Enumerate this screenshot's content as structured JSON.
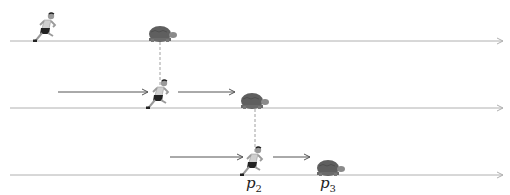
{
  "diagram": {
    "colors": {
      "track": "#b0b0b0",
      "arrow": "#555555",
      "dashed": "#888888",
      "tortoise_shell": "#5f5f5f",
      "tortoise_body": "#8a8a8a",
      "runner_skin": "#9a9a9a",
      "runner_shorts": "#222222",
      "runner_shirt": "#cfcfcf"
    },
    "rows": [
      {
        "track_y": 41,
        "runner_x": 45,
        "tortoise_x": 160,
        "arrows": []
      },
      {
        "track_y": 108,
        "runner_x": 158,
        "tortoise_x": 252,
        "arrows": [
          {
            "x1": 58,
            "x2": 148
          },
          {
            "x1": 178,
            "x2": 235
          }
        ]
      },
      {
        "track_y": 175,
        "runner_x": 252,
        "tortoise_x": 328,
        "arrows": [
          {
            "x1": 170,
            "x2": 243
          },
          {
            "x1": 273,
            "x2": 310
          }
        ]
      }
    ],
    "labels": [
      {
        "text": "p",
        "sub": "2",
        "x": 246,
        "y": 174
      },
      {
        "text": "p",
        "sub": "3",
        "x": 320,
        "y": 174
      }
    ]
  }
}
